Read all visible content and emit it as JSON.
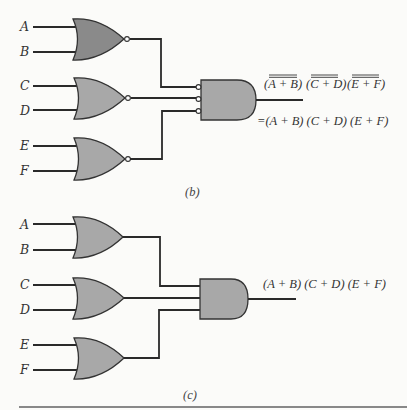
{
  "figure_b": {
    "caption": "(b)",
    "inputs": [
      "A",
      "B",
      "C",
      "D",
      "E",
      "F"
    ],
    "gates": [
      {
        "type": "NOR",
        "inputs": [
          "A",
          "B"
        ]
      },
      {
        "type": "NOR",
        "inputs": [
          "C",
          "D"
        ]
      },
      {
        "type": "NOR",
        "inputs": [
          "E",
          "F"
        ]
      },
      {
        "type": "AND",
        "inverted_inputs": true
      }
    ],
    "output_label_top": {
      "terms": [
        "(A + B)",
        "(C + D)",
        "(E + F)"
      ],
      "double_overline": true
    },
    "output_label_bottom": "=(A + B) (C + D) (E + F)"
  },
  "figure_c": {
    "caption": "(c)",
    "inputs": [
      "A",
      "B",
      "C",
      "D",
      "E",
      "F"
    ],
    "gates": [
      {
        "type": "OR",
        "inputs": [
          "A",
          "B"
        ]
      },
      {
        "type": "OR",
        "inputs": [
          "C",
          "D"
        ]
      },
      {
        "type": "OR",
        "inputs": [
          "E",
          "F"
        ]
      },
      {
        "type": "AND"
      }
    ],
    "output_label": "(A + B) (C + D) (E + F)"
  },
  "colors": {
    "gate_fill_dark": "#8a8a8a",
    "gate_fill": "#a8a8a8",
    "wire": "#2a2a2a",
    "background": "#fbfbf9"
  }
}
